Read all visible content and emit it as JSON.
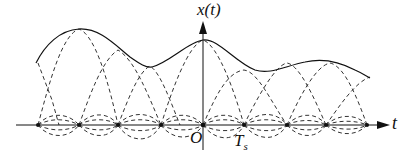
{
  "diagram": {
    "axes": {
      "y_label": "x(t)",
      "x_label": "t",
      "origin_label": "O",
      "period_label": "T",
      "period_subscript": "s"
    },
    "colors": {
      "line": "#111111",
      "background": "#ffffff"
    },
    "sample_count": 9,
    "legend": {
      "solid": "reconstructed signal x(t)",
      "dashed": "shifted sinc interpolation pulses"
    }
  }
}
